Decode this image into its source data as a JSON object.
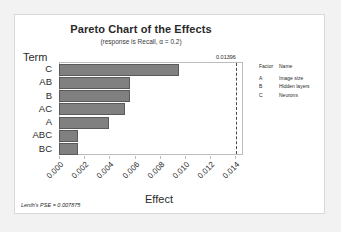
{
  "chart_data": {
    "type": "bar",
    "orientation": "horizontal",
    "title": "Pareto Chart of the Effects",
    "subtitle": "(response is Recall, α = 0.2)",
    "xlabel": "Effect",
    "ylabel": "Term",
    "categories": [
      "C",
      "AB",
      "B",
      "AC",
      "A",
      "ABC",
      "BC"
    ],
    "values": [
      0.0095,
      0.0056,
      0.0056,
      0.0052,
      0.004,
      0.0015,
      0.0015
    ],
    "xlim": [
      0.0,
      0.0146
    ],
    "xticks": [
      0.0,
      0.002,
      0.004,
      0.006,
      0.008,
      0.01,
      0.012,
      0.014
    ],
    "xticklabels": [
      "0.000",
      "0.002",
      "0.004",
      "0.006",
      "0.008",
      "0.010",
      "0.012",
      "0.014"
    ],
    "grid": false,
    "legend_position": "right",
    "bar_color": "#808080",
    "bar_edge_color": "#5a5a5a",
    "reference_line": {
      "value": 0.01396,
      "label": "0.01396",
      "style": "dashed",
      "color": "#4a4a4a"
    },
    "annotations": [
      "Lenth's PSE = 0.007875"
    ]
  },
  "legend": {
    "headers": {
      "factor": "Factor",
      "name": "Name"
    },
    "rows": [
      {
        "factor": "A",
        "name": "Image size"
      },
      {
        "factor": "B",
        "name": "Hidden layers"
      },
      {
        "factor": "C",
        "name": "Neurons"
      }
    ]
  },
  "footnote": "Lenth's PSE = 0.007875"
}
